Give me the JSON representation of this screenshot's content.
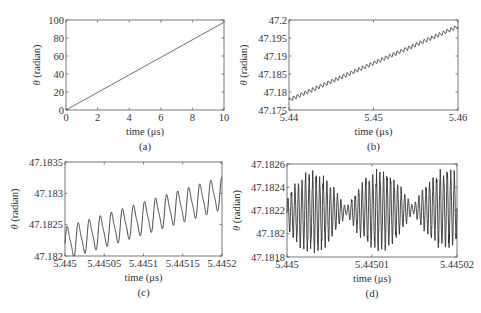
{
  "chart_data": [
    {
      "id": "a",
      "type": "line",
      "caption": "(a)",
      "xlabel": "time (μs)",
      "ylabel_symbol": "θ",
      "ylabel_unit": " (radian)",
      "xlim": [
        0,
        10
      ],
      "ylim": [
        0,
        100
      ],
      "xticks": [
        0,
        2,
        4,
        6,
        8,
        10
      ],
      "xtick_labels": [
        "0",
        "2",
        "4",
        "6",
        "8",
        "10"
      ],
      "yticks": [
        0,
        20,
        40,
        60,
        80,
        100
      ],
      "ytick_labels": [
        "0",
        "20",
        "40",
        "60",
        "80",
        "100"
      ],
      "frame": {
        "left": 66,
        "top": 20,
        "right": 224,
        "bottom": 110
      },
      "series": [
        {
          "name": "theta",
          "x": [
            0,
            10
          ],
          "y": [
            0,
            97.5
          ]
        }
      ],
      "generator": {
        "kind": "linear",
        "x0": 0,
        "x1": 10,
        "y0": 0,
        "y1": 97.5,
        "osc": []
      }
    },
    {
      "id": "b",
      "type": "line",
      "caption": "(b)",
      "xlabel": "time (μs)",
      "ylabel_symbol": "θ",
      "ylabel_unit": " (radian)",
      "xlim": [
        5.44,
        5.46
      ],
      "ylim": [
        47.175,
        47.2
      ],
      "xticks": [
        5.44,
        5.45,
        5.46
      ],
      "xtick_labels": [
        "5.44",
        "5.45",
        "5.46"
      ],
      "yticks": [
        47.175,
        47.18,
        47.185,
        47.19,
        47.195,
        47.2
      ],
      "ytick_labels": [
        "47.175",
        "47.18",
        "47.185",
        "47.19",
        "47.195",
        "47.2"
      ],
      "frame": {
        "left": 289,
        "top": 20,
        "right": 458,
        "bottom": 110
      },
      "series": [
        {
          "name": "theta",
          "x": [
            5.44,
            5.45,
            5.46
          ],
          "y": [
            47.1778,
            47.1883,
            47.1985
          ]
        }
      ],
      "generator": {
        "kind": "linear",
        "x0": 5.44,
        "x1": 5.46,
        "y0": 47.1778,
        "y1": 47.1982,
        "osc": [
          {
            "cycles": 44,
            "amp": 0.0005
          }
        ]
      }
    },
    {
      "id": "c",
      "type": "line",
      "caption": "(c)",
      "xlabel": "time (μs)",
      "ylabel_symbol": "θ",
      "ylabel_unit": " (radian)",
      "xlim": [
        5.445,
        5.4452
      ],
      "ylim": [
        47.182,
        47.1835
      ],
      "xticks": [
        5.445,
        5.44505,
        5.4451,
        5.44515,
        5.4452
      ],
      "xtick_labels": [
        "5.445",
        "5.44505",
        "5.4451",
        "5.44515",
        "5.4452"
      ],
      "yticks": [
        47.182,
        47.1825,
        47.183,
        47.1835
      ],
      "ytick_labels": [
        "47.182",
        "47.1825",
        "47.183",
        "47.1835"
      ],
      "frame": {
        "left": 65,
        "top": 162,
        "right": 222,
        "bottom": 256
      },
      "series": [
        {
          "name": "theta",
          "x": [
            5.445,
            5.4451,
            5.4452
          ],
          "y": [
            47.18225,
            47.18265,
            47.183
          ]
        }
      ],
      "generator": {
        "kind": "linear",
        "x0": 5.445,
        "x1": 5.4452,
        "y0": 47.1822,
        "y1": 47.183,
        "osc": [
          {
            "cycles": 14.2,
            "amp": 0.00024
          }
        ]
      }
    },
    {
      "id": "d",
      "type": "line",
      "caption": "(d)",
      "xlabel": "time (μs)",
      "ylabel_symbol": "θ",
      "ylabel_unit": " (radian)",
      "xlim": [
        5.445,
        5.44502
      ],
      "ylim": [
        47.1818,
        47.1826
      ],
      "xticks": [
        5.445,
        5.44501,
        5.44502
      ],
      "xtick_labels": [
        "5.445",
        "5.44501",
        "5.44502"
      ],
      "yticks": [
        47.1818,
        47.182,
        47.1822,
        47.1824,
        47.1826
      ],
      "ytick_labels": [
        "47.1818",
        "47.182",
        "47.1822",
        "47.1824",
        "47.1826"
      ],
      "frame": {
        "left": 287,
        "top": 164,
        "right": 457,
        "bottom": 257
      },
      "series": [
        {
          "name": "theta",
          "x": [
            5.445,
            5.44501,
            5.44502
          ],
          "y": [
            47.1822,
            47.1822,
            47.1822
          ]
        }
      ],
      "generator": {
        "kind": "beat",
        "x0": 5.445,
        "x1": 5.44502,
        "y0": 47.18218,
        "y1": 47.18222,
        "carrier_cycles": 48,
        "envelope_cycles": 2.55,
        "amp": 0.00027,
        "base_amp": 3e-05
      }
    }
  ]
}
